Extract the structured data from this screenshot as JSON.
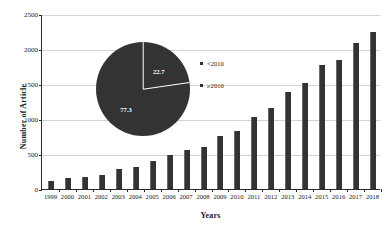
{
  "chart_data": {
    "type": "bar",
    "title": "",
    "xlabel": "Years",
    "ylabel": "Number of Article",
    "categories": [
      "1999",
      "2000",
      "2001",
      "2002",
      "2003",
      "2004",
      "2005",
      "2006",
      "2007",
      "2008",
      "2009",
      "2010",
      "2011",
      "2012",
      "2013",
      "2014",
      "2015",
      "2016",
      "2017",
      "2018"
    ],
    "values": [
      110,
      158,
      172,
      205,
      283,
      312,
      400,
      482,
      553,
      597,
      752,
      822,
      1030,
      1162,
      1382,
      1512,
      1768,
      1845,
      2085,
      2240
    ],
    "ylim": [
      0,
      2500
    ],
    "yticks": [
      0,
      500,
      1000,
      1500,
      2000,
      2500
    ],
    "ytick_labels": [
      "0",
      "500",
      "1000",
      "1500",
      "2000",
      "2500"
    ],
    "grid": true,
    "bar_color": "#333333",
    "inset_pie": {
      "type": "pie",
      "labels": [
        "<2010",
        "≥2010"
      ],
      "values": [
        22.7,
        77.3
      ],
      "value_labels": [
        "22.7",
        "77.3"
      ],
      "slice_color": "#333333",
      "label_color": "#ffffff",
      "legend_position": "right"
    }
  }
}
